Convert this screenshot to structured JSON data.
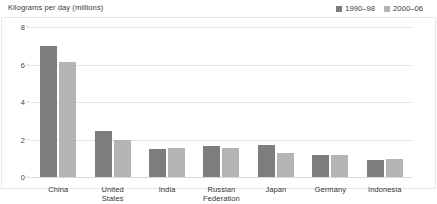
{
  "chart_data": {
    "type": "bar",
    "title": "Kilograms per day (millions)",
    "xlabel": "",
    "ylabel": "Kilograms per day (millions)",
    "ylim": [
      0,
      8
    ],
    "yticks": [
      0,
      2,
      4,
      6,
      8
    ],
    "grid": true,
    "legend_position": "top-right",
    "categories": [
      "China",
      "United States",
      "India",
      "Russian\nFederation",
      "Japan",
      "Germany",
      "Indonesia"
    ],
    "series": [
      {
        "name": "1990–98",
        "color": "#7d7d7d",
        "values": [
          7.0,
          2.45,
          1.5,
          1.65,
          1.7,
          1.2,
          0.9
        ]
      },
      {
        "name": "2000–06",
        "color": "#b4b4b4",
        "values": [
          6.15,
          2.0,
          1.55,
          1.55,
          1.3,
          1.15,
          0.95
        ]
      }
    ]
  }
}
